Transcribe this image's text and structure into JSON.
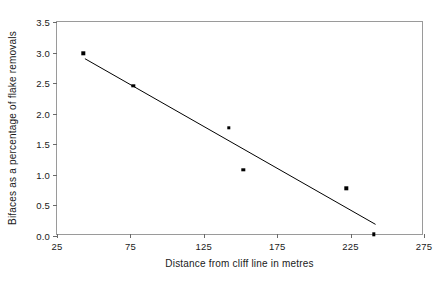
{
  "chart_data": {
    "type": "scatter",
    "title": "",
    "xlabel": "Distance from cliff line in metres",
    "ylabel": "Bifaces as a percentage of flake removals",
    "xlim": [
      25,
      275
    ],
    "ylim": [
      0.0,
      3.5
    ],
    "grid": false,
    "legend": null,
    "xticks": [
      "25",
      "75",
      "125",
      "175",
      "225",
      "275"
    ],
    "xtick_values": [
      25,
      75,
      125,
      175,
      225,
      275
    ],
    "yticks": [
      "0.0",
      "0.5",
      "1.0",
      "1.5",
      "2.0",
      "2.5",
      "3.0",
      "3.5"
    ],
    "ytick_values": [
      0.0,
      0.5,
      1.0,
      1.5,
      2.0,
      2.5,
      3.0,
      3.5
    ],
    "points": [
      {
        "x": 43,
        "y": 2.99
      },
      {
        "x": 77,
        "y": 2.46
      },
      {
        "x": 142,
        "y": 1.77
      },
      {
        "x": 152,
        "y": 1.08
      },
      {
        "x": 222,
        "y": 0.78
      },
      {
        "x": 241,
        "y": 0.03
      }
    ],
    "series": [
      {
        "name": "bifaces-vs-distance",
        "x": [
          43,
          77,
          142,
          152,
          222,
          241
        ],
        "values": [
          2.99,
          2.46,
          1.77,
          1.08,
          0.78,
          0.03
        ]
      }
    ],
    "trend_line": {
      "name": "linear-fit",
      "x_start": 44,
      "y_start": 2.9,
      "x_end": 242,
      "y_end": 0.19
    }
  }
}
